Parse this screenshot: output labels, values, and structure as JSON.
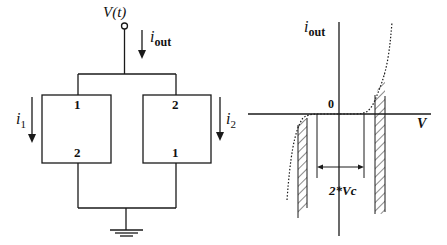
{
  "circuit": {
    "source_label": "V(t)",
    "output_current_label_main": "i",
    "output_current_label_sub": "out",
    "branch_left": {
      "current_label_main": "i",
      "current_label_sub": "1",
      "top_terminal": "1",
      "bottom_terminal": "2"
    },
    "branch_right": {
      "current_label_main": "i",
      "current_label_sub": "2",
      "top_terminal": "2",
      "bottom_terminal": "1"
    },
    "ground": "ground"
  },
  "graph": {
    "y_axis_label_main": "i",
    "y_axis_label_sub": "out",
    "x_axis_label": "V",
    "origin_label": "0",
    "gap_label": "2*Vc"
  },
  "colors": {
    "stroke": "#1a1a1a",
    "background": "#ffffff"
  }
}
